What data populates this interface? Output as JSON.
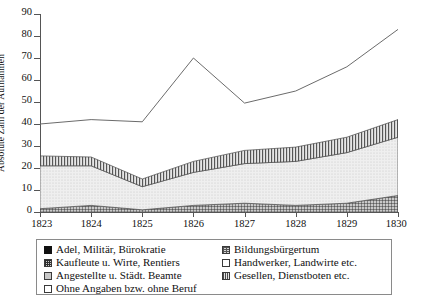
{
  "chart_data": {
    "type": "area",
    "title": "",
    "xlabel": "",
    "ylabel": "Absolute Zahl der Aufnahmen",
    "categories": [
      "1823",
      "1824",
      "1825",
      "1826",
      "1827",
      "1828",
      "1829",
      "1830"
    ],
    "x": [
      1823,
      1824,
      1825,
      1826,
      1827,
      1828,
      1829,
      1830
    ],
    "ylim": [
      0,
      90
    ],
    "yticks": [
      0,
      10,
      20,
      30,
      40,
      50,
      60,
      70,
      80,
      90
    ],
    "grid": false,
    "legend_position": "below",
    "stacked": true,
    "series": [
      {
        "name": "Adel, Militär, Bürokratie",
        "pattern": "solid-black",
        "values": [
          0,
          0,
          0,
          0,
          0,
          0,
          0,
          0
        ]
      },
      {
        "name": "Kaufleute u. Wirte, Rentiers",
        "pattern": "cross-hatch-dark",
        "values": [
          1.5,
          3.0,
          1.0,
          3.0,
          4.0,
          3.0,
          4.0,
          7.5
        ]
      },
      {
        "name": "Angestellte u. Städt. Beamte",
        "pattern": "gray-dots",
        "values": [
          0,
          0,
          0,
          0,
          0,
          0,
          0,
          0
        ]
      },
      {
        "name": "Ohne Angaben bzw. ohne Beruf",
        "pattern": "open-white",
        "values": [
          0,
          0,
          0,
          0,
          0,
          0,
          0,
          0
        ]
      },
      {
        "name": "Bildungsbürgertum",
        "pattern": "h-grid",
        "values": [
          0,
          0,
          0,
          0,
          0,
          0,
          0,
          0
        ]
      },
      {
        "name": "Handwerker, Landwirte etc.",
        "pattern": "light-dots",
        "values": [
          19.5,
          18.0,
          10.5,
          15.0,
          18.0,
          20.0,
          23.0,
          26.5
        ]
      },
      {
        "name": "Gesellen, Dienstboten etc.",
        "pattern": "vertical-lines",
        "values": [
          4.5,
          4.0,
          3.5,
          5.0,
          6.0,
          6.5,
          7.0,
          8.0
        ]
      }
    ],
    "stack_tops": {
      "layer1_kaufleute": [
        1.5,
        3.0,
        1.0,
        3.0,
        4.0,
        3.0,
        4.0,
        7.5
      ],
      "layer2_handwerker": [
        21.0,
        21.0,
        11.5,
        18.0,
        22.0,
        23.0,
        27.0,
        34.0
      ],
      "layer3_gesellen": [
        25.5,
        25.0,
        15.0,
        23.0,
        28.0,
        29.5,
        34.0,
        42.0
      ]
    },
    "total_line": {
      "name": "Gesamt",
      "values": [
        40.0,
        42.0,
        41.0,
        70.0,
        49.5,
        55.0,
        66.0,
        83.0
      ]
    }
  },
  "legend": {
    "left_column": [
      {
        "label": "Adel, Militär, Bürokratie",
        "swatch": "solid-black"
      },
      {
        "label": "Kaufleute u. Wirte, Rentiers",
        "swatch": "cross-hatch-dark"
      },
      {
        "label": "Angestellte u. Städt. Beamte",
        "swatch": "gray-dots"
      },
      {
        "label": "Ohne Angaben bzw. ohne Beruf",
        "swatch": "open-white"
      }
    ],
    "right_column": [
      {
        "label": "Bildungsbürgertum",
        "swatch": "h-grid"
      },
      {
        "label": "Handwerker, Landwirte etc.",
        "swatch": "open-white"
      },
      {
        "label": "Gesellen, Dienstboten etc.",
        "swatch": "vertical-lines"
      }
    ]
  },
  "colors": {
    "axis": "#555555",
    "text": "#111111",
    "line": "#6b6b6b",
    "legend_border": "#8a8a8a",
    "background": "#ffffff"
  }
}
